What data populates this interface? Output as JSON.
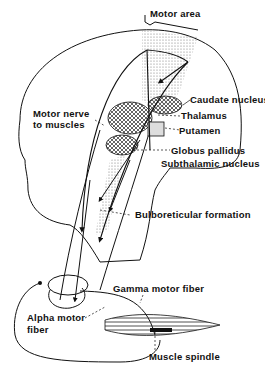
{
  "diagram": {
    "labels": {
      "motor_area": "Motor area",
      "caudate_nucleus": "Caudate nucleus",
      "motor_nerve_line1": "Motor nerve",
      "motor_nerve_line2": "to muscles",
      "thalamus": "Thalamus",
      "putamen": "Putamen",
      "globus_pallidus": "Globus pallidus",
      "subthalamic_nucleus": "Subthalamic nucleus",
      "bulboreticular_formation": "Bulboreticular formation",
      "gamma_motor_fiber": "Gamma motor fiber",
      "alpha_motor_line1": "Alpha motor",
      "alpha_motor_line2": "fiber",
      "muscle_spindle": "Muscle spindle"
    },
    "colors": {
      "ink": "#111111",
      "background": "#ffffff",
      "stipple": "#9a9a9a"
    }
  }
}
